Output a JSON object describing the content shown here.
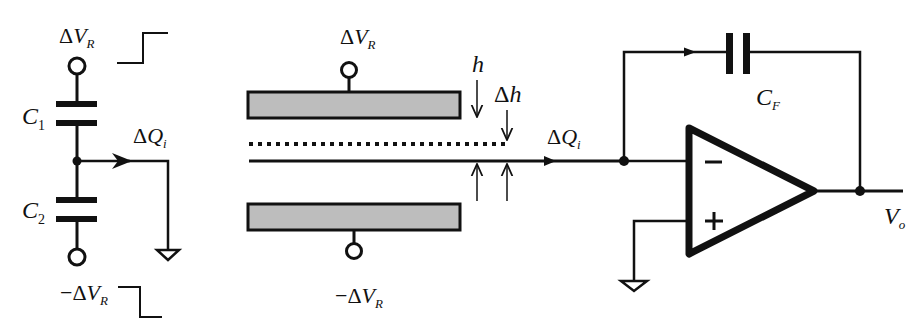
{
  "diagram": {
    "type": "circuit-schematic",
    "colors": {
      "stroke": "#111111",
      "plate_fill": "#bdbdbd",
      "background": "#ffffff"
    },
    "divider": {
      "labels": {
        "top_voltage": {
          "delta": "Δ",
          "var": "V",
          "sub": "R"
        },
        "bottom_voltage": {
          "neg": "−",
          "delta": "Δ",
          "var": "V",
          "sub": "R"
        },
        "c1": {
          "var": "C",
          "sub": "1"
        },
        "c2": {
          "var": "C",
          "sub": "2"
        },
        "charge": {
          "delta": "Δ",
          "var": "Q",
          "sub": "i"
        }
      }
    },
    "plates": {
      "labels": {
        "top_voltage": {
          "delta": "Δ",
          "var": "V",
          "sub": "R"
        },
        "bottom_voltage": {
          "neg": "−",
          "delta": "Δ",
          "var": "V",
          "sub": "R"
        },
        "gap": {
          "var": "h"
        },
        "displacement": {
          "delta": "Δ",
          "var": "h"
        }
      }
    },
    "amplifier": {
      "labels": {
        "charge": {
          "delta": "Δ",
          "var": "Q",
          "sub": "i"
        },
        "feedback_cap": {
          "var": "C",
          "sub": "F"
        },
        "output": {
          "var": "V",
          "sub": "o"
        },
        "inverting": "−",
        "noninverting": "+"
      }
    }
  }
}
